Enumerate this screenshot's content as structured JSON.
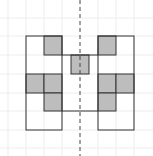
{
  "diagram": {
    "type": "symmetric-grid-figure",
    "cell_size": 18,
    "colors": {
      "background": "#ffffff",
      "grid": "#ececec",
      "outline": "#333333",
      "shaded": "#bdbdbd",
      "axis": "#444444"
    },
    "symmetry_axis": {
      "x": 80,
      "style": "dashed"
    },
    "outline_path": "M26,36 H62 V55 H71 V55 H89 V55 H98 V36 H134 V130 H98 V111 H62 V130 H26 Z",
    "shaded_cells": [
      {
        "x": 44,
        "y": 36,
        "side": "left"
      },
      {
        "x": 71,
        "y": 55,
        "side": "center"
      },
      {
        "x": 26,
        "y": 74,
        "side": "left"
      },
      {
        "x": 44,
        "y": 74,
        "side": "left"
      },
      {
        "x": 44,
        "y": 93,
        "side": "left"
      },
      {
        "x": 98,
        "y": 36,
        "side": "right"
      },
      {
        "x": 98,
        "y": 74,
        "side": "right"
      },
      {
        "x": 116,
        "y": 74,
        "side": "right"
      },
      {
        "x": 98,
        "y": 93,
        "side": "right"
      }
    ]
  }
}
